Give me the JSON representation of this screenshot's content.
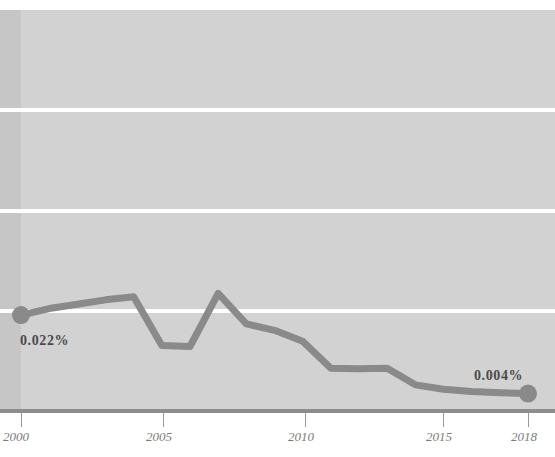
{
  "title": "",
  "axis": {
    "x_ticks": [
      "2000",
      "2005",
      "2010",
      "2015",
      "2018"
    ]
  },
  "labels": {
    "start_value": "0.022%",
    "end_value": "0.004%"
  },
  "colors": {
    "plot_background": "#d2d2d2",
    "left_band": "#c6c6c6",
    "gridline": "#ffffff",
    "series_line": "#8a8a8a",
    "axis_line": "#8d8d8d",
    "tick_label": "#7c7c7c",
    "value_label": "#4a4a4a"
  },
  "chart_data": {
    "type": "line",
    "title": "",
    "subtitle": "",
    "xlabel": "",
    "ylabel": "",
    "xlim": [
      2000,
      2018
    ],
    "ylim": [
      0,
      0.092
    ],
    "grid": true,
    "gridlines_y": [
      0.023,
      0.046,
      0.069
    ],
    "legend": "none",
    "x": [
      2000,
      2001,
      2002,
      2003,
      2004,
      2005,
      2006,
      2007,
      2008,
      2009,
      2010,
      2011,
      2012,
      2013,
      2014,
      2015,
      2016,
      2017,
      2018
    ],
    "series": [
      {
        "name": "share",
        "units": "%",
        "values": [
          0.022,
          0.0235,
          0.0245,
          0.0255,
          0.0262,
          0.015,
          0.0148,
          0.027,
          0.02,
          0.0185,
          0.016,
          0.0098,
          0.0097,
          0.0098,
          0.006,
          0.005,
          0.0045,
          0.0042,
          0.004
        ]
      }
    ],
    "annotations": [
      {
        "text": "0.022%",
        "x": 2000,
        "y": 0.022,
        "position": "above-right"
      },
      {
        "text": "0.004%",
        "x": 2018,
        "y": 0.004,
        "position": "above-left"
      }
    ],
    "markers": [
      {
        "x": 2000,
        "y": 0.022
      },
      {
        "x": 2018,
        "y": 0.004
      }
    ]
  }
}
